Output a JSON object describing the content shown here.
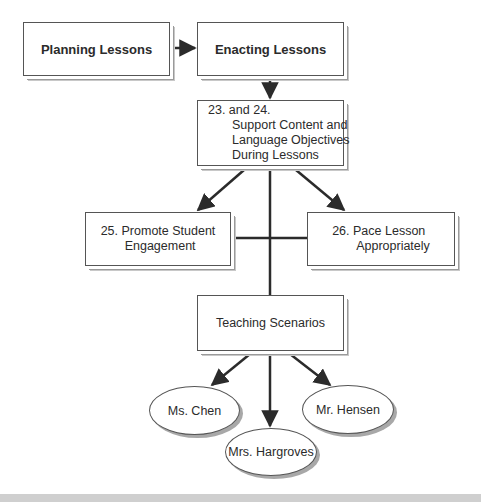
{
  "diagram": {
    "nodes": {
      "planning": {
        "label": "Planning Lessons"
      },
      "enacting": {
        "label": "Enacting Lessons"
      },
      "support": {
        "line1": "23. and 24.",
        "line2": "Support Content and",
        "line3": "Language Objectives",
        "line4": "During Lessons"
      },
      "engagement": {
        "line1": "25.  Promote Student",
        "line2": "Engagement"
      },
      "pace": {
        "line1": "26.  Pace Lesson",
        "line2": "Appropriately"
      },
      "scenarios": {
        "label": "Teaching Scenarios"
      },
      "chen": {
        "label": "Ms. Chen"
      },
      "hargroves": {
        "label": "Mrs. Hargroves"
      },
      "hensen": {
        "label": "Mr. Hensen"
      }
    },
    "edges": [
      {
        "from": "Planning Lessons",
        "to": "Enacting Lessons"
      },
      {
        "from": "Enacting Lessons",
        "to": "23. and 24. Support Content and Language Objectives During Lessons"
      },
      {
        "from": "23. and 24.",
        "to": "25. Promote Student Engagement"
      },
      {
        "from": "23. and 24.",
        "to": "26. Pace Lesson Appropriately"
      },
      {
        "from": "23. and 24.",
        "to": "Teaching Scenarios"
      },
      {
        "from": "Teaching Scenarios",
        "to": "Ms. Chen"
      },
      {
        "from": "Teaching Scenarios",
        "to": "Mrs. Hargroves"
      },
      {
        "from": "Teaching Scenarios",
        "to": "Mr. Hensen"
      }
    ],
    "colors": {
      "line": "#2b2b2b",
      "border": "#555555",
      "shadow": "#9a9a9a",
      "band": "#cfcfcf"
    }
  }
}
